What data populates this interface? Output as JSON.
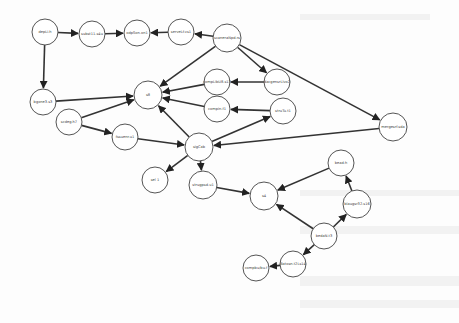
{
  "graph": {
    "nodes": [
      {
        "id": "n0",
        "label": "depLi.h",
        "x": 45,
        "y": 32,
        "r": 13
      },
      {
        "id": "n1",
        "label": "subst11.s4u",
        "x": 92,
        "y": 34,
        "r": 13
      },
      {
        "id": "n2",
        "label": "odpSon.on1",
        "x": 137,
        "y": 33,
        "r": 13
      },
      {
        "id": "n3",
        "label": "serveLf.vs1",
        "x": 181,
        "y": 32,
        "r": 13
      },
      {
        "id": "n4",
        "label": "scaneraNpd.rs",
        "x": 227,
        "y": 38,
        "r": 14
      },
      {
        "id": "n5",
        "label": "bgxne3.s3",
        "x": 43,
        "y": 102,
        "r": 13
      },
      {
        "id": "n6",
        "label": "s8",
        "x": 148,
        "y": 95,
        "r": 14
      },
      {
        "id": "n7",
        "label": "compLibU8.s13",
        "x": 217,
        "y": 82,
        "r": 13
      },
      {
        "id": "n8",
        "label": "dacgensrLlvo2",
        "x": 277,
        "y": 82,
        "r": 13
      },
      {
        "id": "n9",
        "label": "compin.f1",
        "x": 217,
        "y": 109,
        "r": 13
      },
      {
        "id": "n10",
        "label": "struTu.t1",
        "x": 283,
        "y": 111,
        "r": 13
      },
      {
        "id": "n11",
        "label": "scdeg.h7",
        "x": 69,
        "y": 122,
        "r": 13
      },
      {
        "id": "n12",
        "label": "fssuenr.u1",
        "x": 125,
        "y": 137,
        "r": 13
      },
      {
        "id": "n13",
        "label": "sigCab",
        "x": 199,
        "y": 147,
        "r": 14
      },
      {
        "id": "n14",
        "label": "mergesrf.sda",
        "x": 393,
        "y": 127,
        "r": 14
      },
      {
        "id": "n15",
        "label": "sel 1",
        "x": 155,
        "y": 180,
        "r": 13
      },
      {
        "id": "n16",
        "label": "strugpsd.u1",
        "x": 203,
        "y": 185,
        "r": 14
      },
      {
        "id": "n17",
        "label": "s4",
        "x": 264,
        "y": 196,
        "r": 14
      },
      {
        "id": "n18",
        "label": "bead:h",
        "x": 341,
        "y": 163,
        "r": 13
      },
      {
        "id": "n19",
        "label": "blaugsr32.s16",
        "x": 357,
        "y": 204,
        "r": 14
      },
      {
        "id": "n20",
        "label": "bedaN.t3",
        "x": 324,
        "y": 236,
        "r": 13
      },
      {
        "id": "n21",
        "label": "Batosn.t2Ls14",
        "x": 293,
        "y": 264,
        "r": 13
      },
      {
        "id": "n22",
        "label": "compbu/bu.f",
        "x": 256,
        "y": 268,
        "r": 13
      }
    ],
    "edges": [
      [
        "n0",
        "n1"
      ],
      [
        "n1",
        "n2"
      ],
      [
        "n3",
        "n2"
      ],
      [
        "n4",
        "n3"
      ],
      [
        "n0",
        "n5"
      ],
      [
        "n5",
        "n6"
      ],
      [
        "n4",
        "n6"
      ],
      [
        "n4",
        "n8"
      ],
      [
        "n4",
        "n14"
      ],
      [
        "n7",
        "n6"
      ],
      [
        "n8",
        "n7"
      ],
      [
        "n9",
        "n6"
      ],
      [
        "n10",
        "n9"
      ],
      [
        "n11",
        "n6"
      ],
      [
        "n11",
        "n12"
      ],
      [
        "n12",
        "n13"
      ],
      [
        "n13",
        "n6"
      ],
      [
        "n13",
        "n10"
      ],
      [
        "n14",
        "n13"
      ],
      [
        "n13",
        "n15"
      ],
      [
        "n13",
        "n16"
      ],
      [
        "n16",
        "n17"
      ],
      [
        "n18",
        "n17"
      ],
      [
        "n20",
        "n17"
      ],
      [
        "n20",
        "n19"
      ],
      [
        "n19",
        "n18"
      ],
      [
        "n20",
        "n21"
      ],
      [
        "n21",
        "n22"
      ]
    ]
  }
}
